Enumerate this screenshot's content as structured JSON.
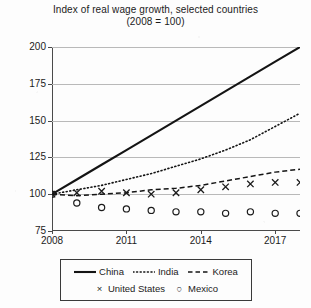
{
  "chart_data": {
    "type": "line",
    "title": "Index of real wage growth, selected countries",
    "subtitle": "(2008 = 100)",
    "xlabel": "",
    "ylabel": "",
    "xlim": [
      2008,
      2018
    ],
    "ylim": [
      75,
      200
    ],
    "yticks": [
      75,
      100,
      125,
      150,
      175,
      200
    ],
    "xticks": [
      2008,
      2011,
      2014,
      2017
    ],
    "xtick_labels": [
      "2008",
      "2011",
      "2014",
      "2017"
    ],
    "ytick_labels": [
      "75",
      "100",
      "125",
      "150",
      "175",
      "200"
    ],
    "grid": "horizontal",
    "legend_position": "below-center",
    "x": [
      2008,
      2009,
      2010,
      2011,
      2012,
      2013,
      2014,
      2015,
      2016,
      2017,
      2018
    ],
    "series": [
      {
        "name": "China",
        "style": "solid",
        "values": [
          100,
          110,
          120,
          130,
          140,
          150,
          160,
          170,
          180,
          190,
          200
        ]
      },
      {
        "name": "India",
        "style": "dotted",
        "values": [
          100,
          103,
          106,
          110,
          114,
          119,
          124,
          130,
          137,
          146,
          155
        ]
      },
      {
        "name": "Korea",
        "style": "dashed",
        "values": [
          100,
          99,
          100,
          101,
          103,
          104,
          106,
          109,
          112,
          115,
          117
        ]
      },
      {
        "name": "United States",
        "style": "markers",
        "marker": "x",
        "values": [
          100,
          101,
          102,
          101,
          100,
          101,
          103,
          105,
          107,
          108,
          108
        ]
      },
      {
        "name": "Mexico",
        "style": "markers",
        "marker": "o",
        "values": [
          100,
          94,
          91,
          90,
          89,
          88,
          88,
          87,
          88,
          87,
          87
        ]
      }
    ]
  },
  "legend": {
    "rows": [
      [
        {
          "label": "China",
          "key": "solid-line-key"
        },
        {
          "label": "India",
          "key": "dotted-line-key"
        },
        {
          "label": "Korea",
          "key": "dashed-line-key"
        }
      ],
      [
        {
          "label": "United States",
          "key": "x-marker-key",
          "glyph": "×"
        },
        {
          "label": "Mexico",
          "key": "o-marker-key",
          "glyph": "○"
        }
      ]
    ]
  },
  "colors": {
    "ink": "#1b1b1b",
    "axis": "#4a4a4a",
    "grid": "#b9b9b9",
    "background": "#fdfdfd"
  }
}
